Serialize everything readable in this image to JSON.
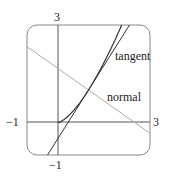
{
  "chart_data": {
    "type": "line",
    "title": "",
    "xlabel": "",
    "ylabel": "",
    "xlim": [
      -1,
      3
    ],
    "ylim": [
      -1,
      3
    ],
    "grid": false,
    "tick_labels": {
      "x_min": "−1",
      "x_max": "3",
      "y_max": "3",
      "y_min": "−1"
    },
    "series": [
      {
        "name": "curve",
        "equation": "y = x^(3/2)",
        "color": "#333333",
        "x": [
          0,
          0.25,
          0.5,
          0.75,
          1,
          1.25,
          1.5,
          1.75,
          2,
          2.08
        ],
        "y": [
          0,
          0.125,
          0.354,
          0.65,
          1,
          1.398,
          1.837,
          2.315,
          2.828,
          3
        ]
      },
      {
        "name": "tangent",
        "equation": "y = 1.5x - 0.5",
        "color": "#333333",
        "x": [
          -0.333,
          2.333
        ],
        "y": [
          -1,
          3
        ]
      },
      {
        "name": "normal",
        "equation": "y = -2/3 x + 5/3",
        "color": "#aaaaaa",
        "x": [
          -1,
          3
        ],
        "y": [
          2.333,
          -0.333
        ]
      }
    ],
    "annotations": [
      {
        "text": "tangent",
        "x": 2.3,
        "y": 2.3
      },
      {
        "text": "normal",
        "x": 2.0,
        "y": 1.0
      }
    ]
  }
}
